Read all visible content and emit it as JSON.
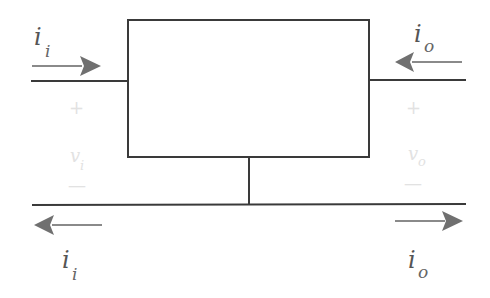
{
  "diagram": {
    "block": {
      "label": ""
    },
    "input_port": {
      "current_top": {
        "symbol": "i",
        "subscript": "i",
        "direction": "into block"
      },
      "current_bottom": {
        "symbol": "i",
        "subscript": "i",
        "direction": "out of block"
      },
      "voltage": {
        "plus": "+",
        "symbol": "v",
        "subscript": "i",
        "minus": "—"
      }
    },
    "output_port": {
      "current_top": {
        "symbol": "i",
        "subscript": "o",
        "direction": "into block"
      },
      "current_bottom": {
        "symbol": "i",
        "subscript": "o",
        "direction": "out of block"
      },
      "voltage": {
        "plus": "+",
        "symbol": "v",
        "subscript": "o",
        "minus": "—"
      }
    },
    "colors": {
      "wire": "#3a3a3a",
      "arrow": "#707070",
      "label": "#555555",
      "faint_label": "#e2e2e2"
    }
  }
}
